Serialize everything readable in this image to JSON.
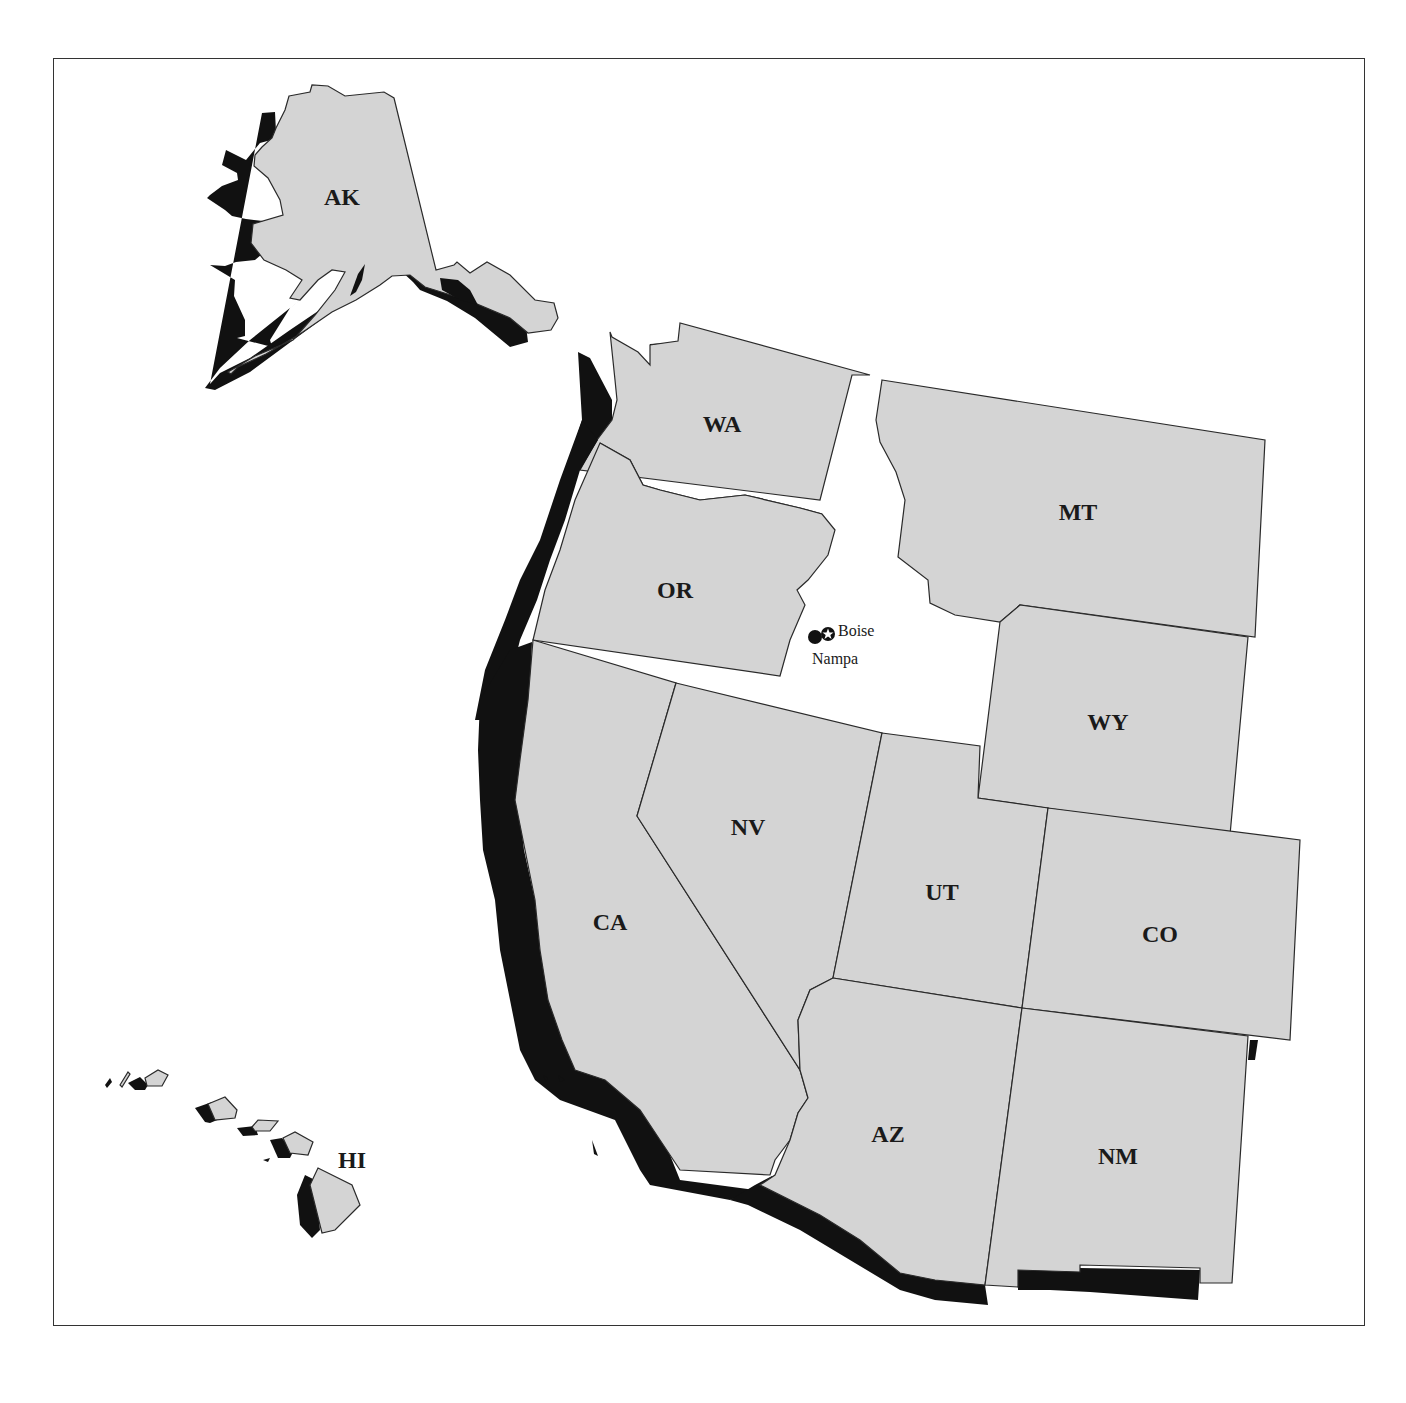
{
  "map": {
    "title": "",
    "colors": {
      "state_fill": "#d4d4d4",
      "shadow": "#111111",
      "highlight_state": "#ffffff",
      "border": "#2a2a2a"
    },
    "highlighted_state": "ID",
    "states": [
      {
        "code": "AK",
        "label": "AK"
      },
      {
        "code": "WA",
        "label": "WA"
      },
      {
        "code": "OR",
        "label": "OR"
      },
      {
        "code": "CA",
        "label": "CA"
      },
      {
        "code": "NV",
        "label": "NV"
      },
      {
        "code": "MT",
        "label": "MT"
      },
      {
        "code": "WY",
        "label": "WY"
      },
      {
        "code": "UT",
        "label": "UT"
      },
      {
        "code": "CO",
        "label": "CO"
      },
      {
        "code": "AZ",
        "label": "AZ"
      },
      {
        "code": "NM",
        "label": "NM"
      },
      {
        "code": "HI",
        "label": "HI"
      }
    ],
    "cities": [
      {
        "name": "Boise",
        "marker": "star-circle-icon"
      },
      {
        "name": "Nampa",
        "marker": "filled-circle-icon"
      }
    ]
  }
}
